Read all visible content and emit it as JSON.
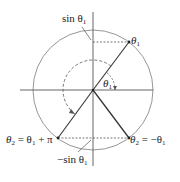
{
  "diagram": {
    "type": "unit-circle",
    "labels": {
      "sin_theta1": "sin θ",
      "neg_sin_theta1": "−sin θ",
      "theta1_point": "θ",
      "theta1_angle": "θ",
      "theta2_neg": "θ",
      "theta2_neg_rhs": " = −θ",
      "theta2_pi": "θ",
      "theta2_pi_rhs": " = θ",
      "theta2_pi_tail": " + π",
      "sub1": "1",
      "sub2": "2"
    },
    "colors": {
      "circle": "#8a8a8a",
      "axis": "#555555",
      "radius": "#333333",
      "dashed": "#555555",
      "text": "#222222"
    }
  }
}
